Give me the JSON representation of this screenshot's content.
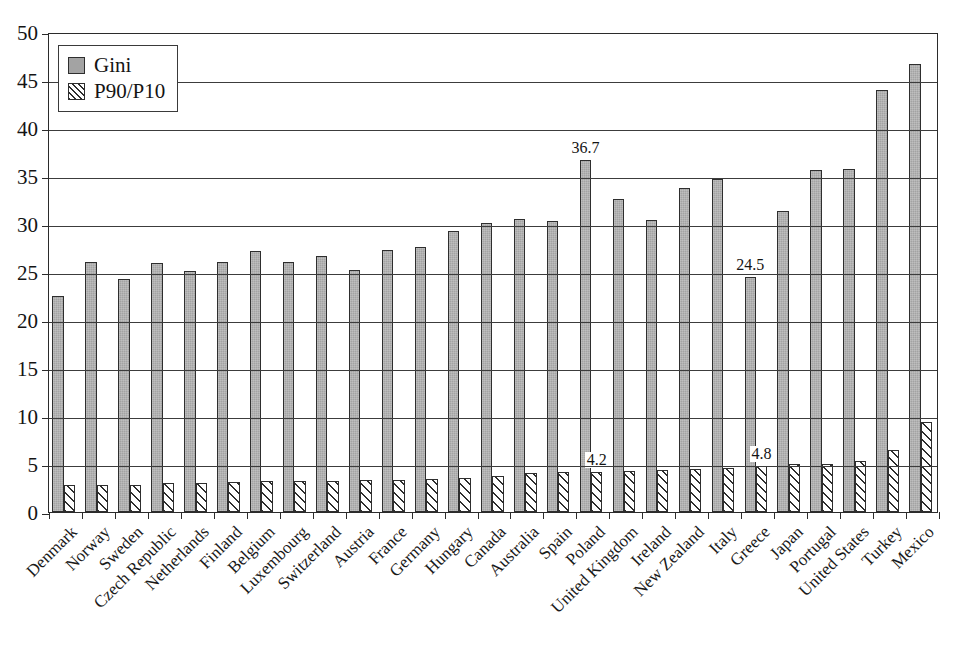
{
  "chart_data": {
    "type": "bar",
    "title": "",
    "subtitle": "",
    "xlabel": "",
    "ylabel": "",
    "ylim": [
      0,
      50
    ],
    "yticks": [
      0,
      5,
      10,
      15,
      20,
      25,
      30,
      35,
      40,
      45,
      50
    ],
    "grid": true,
    "legend_position": "top-left",
    "categories": [
      "Denmark",
      "Norway",
      "Sweden",
      "Czech Republic",
      "Netherlands",
      "Finland",
      "Belgium",
      "Luxembourg",
      "Switzerland",
      "Austria",
      "France",
      "Germany",
      "Hungary",
      "Canada",
      "Australia",
      "Spain",
      "Poland",
      "United Kingdom",
      "Ireland",
      "New Zealand",
      "Italy",
      "Greece",
      "Japan",
      "Portugal",
      "United States",
      "Turkey",
      "Mexico"
    ],
    "series": [
      {
        "name": "Gini",
        "color": "#a3a3a3",
        "pattern": "solid-gray",
        "values": [
          22.5,
          26.0,
          24.3,
          25.9,
          25.1,
          26.0,
          27.2,
          26.0,
          26.7,
          25.2,
          27.3,
          27.6,
          29.3,
          30.1,
          30.5,
          30.3,
          36.7,
          32.6,
          30.4,
          33.7,
          34.7,
          24.5,
          31.4,
          35.6,
          35.7,
          44.0,
          46.7
        ]
      },
      {
        "name": "P90/P10",
        "color": "#ffffff",
        "pattern": "diagonal-hatch",
        "values": [
          2.8,
          2.85,
          2.85,
          3.0,
          3.05,
          3.1,
          3.2,
          3.2,
          3.25,
          3.3,
          3.35,
          3.45,
          3.5,
          3.75,
          4.05,
          4.15,
          4.2,
          4.25,
          4.35,
          4.45,
          4.6,
          4.8,
          4.95,
          5.0,
          5.35,
          6.5,
          9.4
        ]
      }
    ],
    "annotations": [
      {
        "series": "Gini",
        "category": "Poland",
        "text": "36.7"
      },
      {
        "series": "P90/P10",
        "category": "Poland",
        "text": "4.2"
      },
      {
        "series": "Gini",
        "category": "Greece",
        "text": "24.5"
      },
      {
        "series": "P90/P10",
        "category": "Greece",
        "text": "4.8"
      }
    ]
  }
}
